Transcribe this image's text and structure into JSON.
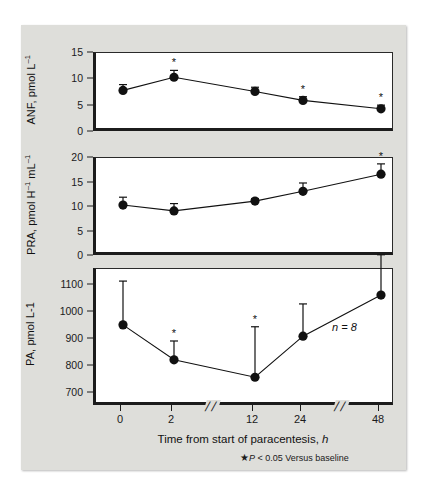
{
  "figure": {
    "background_color": "#dededa",
    "page_color": "#ffffff",
    "axis_color": "#1c1c1c",
    "marker_color": "#111111"
  },
  "xaxis": {
    "title_text": "Time from start of paracentesis,",
    "title_italic": "h",
    "tick_labels": [
      "0",
      "2",
      "12",
      "24",
      "48"
    ],
    "break_glyph": "//",
    "breaks": 2
  },
  "footnote": {
    "star": "★",
    "text_prefix": "P",
    "text": "< 0.05 Versus baseline"
  },
  "annotation": {
    "n_label": "n = 8"
  },
  "panels": [
    {
      "key": "anf",
      "ylabel_main": "ANF, pmol L",
      "ylabel_sup": "-1",
      "ytick_labels": [
        "0",
        "5",
        "10",
        "15"
      ]
    },
    {
      "key": "pra",
      "ylabel_main": "PRA, pmol H",
      "ylabel_sup": "-1",
      "ylabel_main2": " mL",
      "ylabel_sup2": "-1",
      "ytick_labels": [
        "0",
        "5",
        "10",
        "15",
        "20"
      ]
    },
    {
      "key": "pa",
      "ylabel_main": "PA, pmol L-1",
      "ylabel_sup": "",
      "ytick_labels": [
        "700",
        "800",
        "900",
        "1000",
        "1100"
      ]
    }
  ],
  "chart_data": [
    {
      "type": "line",
      "panel": "anf",
      "title": "",
      "xlabel": "Time from start of paracentesis, h",
      "ylabel": "ANF, pmol L-1",
      "x": [
        0,
        2,
        12,
        24,
        48
      ],
      "xtick_labels": [
        "0",
        "2",
        "12",
        "24",
        "48"
      ],
      "values": [
        7.9,
        10.4,
        7.7,
        6.0,
        4.4
      ],
      "err_up": [
        1.1,
        1.3,
        0.8,
        0.7,
        0.7
      ],
      "err_down": [
        0,
        0,
        0,
        0,
        0
      ],
      "significant": [
        false,
        true,
        false,
        true,
        true
      ],
      "ylim": [
        0,
        15
      ],
      "yticks": [
        0,
        5,
        10,
        15
      ],
      "grid": false,
      "legend": "none"
    },
    {
      "type": "line",
      "panel": "pra",
      "title": "",
      "xlabel": "Time from start of paracentesis, h",
      "ylabel": "PRA, pmol H-1 mL-1",
      "x": [
        0,
        2,
        12,
        24,
        48
      ],
      "xtick_labels": [
        "0",
        "2",
        "12",
        "24",
        "48"
      ],
      "values": [
        10.4,
        9.2,
        11.2,
        13.2,
        16.7
      ],
      "err_up": [
        1.6,
        1.5,
        0.5,
        1.7,
        2.1
      ],
      "err_down": [
        0,
        0,
        0,
        0,
        0
      ],
      "significant": [
        false,
        false,
        false,
        false,
        true
      ],
      "ylim": [
        0,
        20
      ],
      "yticks": [
        0,
        5,
        10,
        15,
        20
      ],
      "grid": false,
      "legend": "none"
    },
    {
      "type": "line",
      "panel": "pa",
      "title": "",
      "xlabel": "Time from start of paracentesis, h",
      "ylabel": "PA, pmol L-1",
      "x": [
        0,
        2,
        12,
        24,
        48
      ],
      "xtick_labels": [
        "0",
        "2",
        "12",
        "24",
        "48"
      ],
      "values": [
        952,
        822,
        757,
        910,
        1063
      ],
      "err_up": [
        163,
        70,
        188,
        120,
        150
      ],
      "err_down": [
        0,
        0,
        0,
        0,
        0
      ],
      "significant": [
        false,
        true,
        true,
        false,
        false
      ],
      "ylim": [
        650,
        1160
      ],
      "yticks": [
        700,
        800,
        900,
        1000,
        1100
      ],
      "grid": false,
      "legend": "none",
      "annotation": "n = 8"
    }
  ]
}
